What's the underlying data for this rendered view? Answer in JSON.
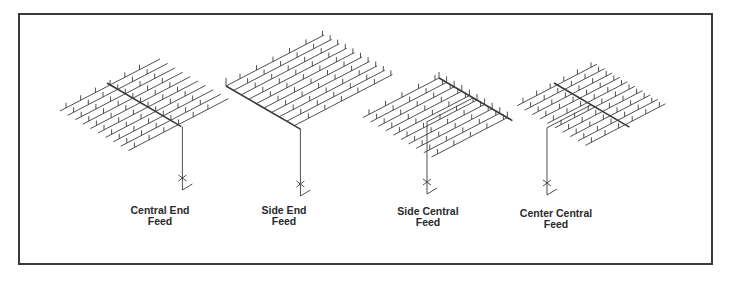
{
  "figure": {
    "type": "sprinkler piping layout comparison",
    "diagrams": [
      {
        "id": "central-end-feed",
        "label_line1": "Central End",
        "label_line2": "Feed",
        "branch_lines": 10,
        "feed_position": "end of cross main, main runs through center of branch lines"
      },
      {
        "id": "side-end-feed",
        "label_line1": "Side End",
        "label_line2": "Feed",
        "branch_lines": 10,
        "feed_position": "end of cross main, main at one side of branch lines"
      },
      {
        "id": "side-central-feed",
        "label_line1": "Side Central",
        "label_line2": "Feed",
        "branch_lines": 10,
        "feed_position": "middle of cross main, main at one side of branch lines"
      },
      {
        "id": "center-central-feed",
        "label_line1": "Center Central",
        "label_line2": "Feed",
        "branch_lines": 10,
        "feed_position": "middle of cross main, main runs through center of branch lines"
      }
    ]
  },
  "colors": {
    "line": "#3c3c3c",
    "frame": "#3a3a3a",
    "text": "#2a2a2a",
    "background": "#ffffff"
  }
}
